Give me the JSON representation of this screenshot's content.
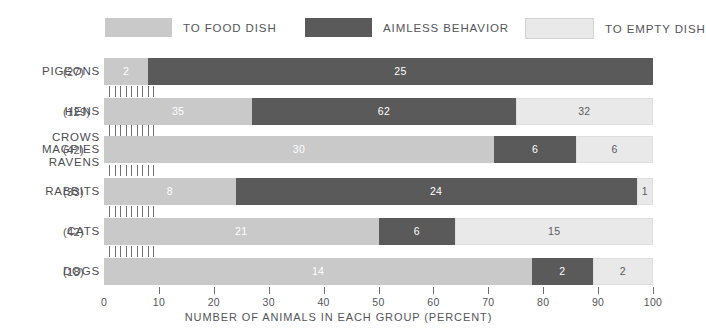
{
  "legend": {
    "items": [
      {
        "label": "TO FOOD DISH",
        "color": "#c9c9c9",
        "key": "to_food_dish"
      },
      {
        "label": "AIMLESS BEHAVIOR",
        "color": "#5a5a5a",
        "key": "aimless_behavior"
      },
      {
        "label": "TO EMPTY DISH",
        "color": "#e9e9e9",
        "key": "to_empty_dish"
      }
    ]
  },
  "axis": {
    "title": "NUMBER OF ANIMALS IN EACH GROUP (PERCENT)",
    "ticks": [
      "0",
      "10",
      "20",
      "30",
      "40",
      "50",
      "60",
      "70",
      "80",
      "90",
      "100"
    ]
  },
  "rows": [
    {
      "name_lines": [
        "PIGEONS"
      ],
      "count": "(27)",
      "segments": [
        {
          "key": "to_food_dish",
          "label": "2",
          "start": 0,
          "end": 8
        },
        {
          "key": "aimless_behavior",
          "label": "25",
          "start": 8,
          "end": 100
        }
      ]
    },
    {
      "name_lines": [
        "HENS"
      ],
      "count": "(129)",
      "segments": [
        {
          "key": "to_food_dish",
          "label": "35",
          "start": 0,
          "end": 27
        },
        {
          "key": "aimless_behavior",
          "label": "62",
          "start": 27,
          "end": 75
        },
        {
          "key": "to_empty_dish",
          "label": "32",
          "start": 75,
          "end": 100
        }
      ]
    },
    {
      "name_lines": [
        "CROWS",
        "MAGPIES",
        "RAVENS"
      ],
      "count": "(42)",
      "segments": [
        {
          "key": "to_food_dish",
          "label": "30",
          "start": 0,
          "end": 71
        },
        {
          "key": "aimless_behavior",
          "label": "6",
          "start": 71,
          "end": 86
        },
        {
          "key": "to_empty_dish",
          "label": "6",
          "start": 86,
          "end": 100
        }
      ]
    },
    {
      "name_lines": [
        "RABBITS"
      ],
      "count": "(33)",
      "segments": [
        {
          "key": "to_food_dish",
          "label": "8",
          "start": 0,
          "end": 24
        },
        {
          "key": "aimless_behavior",
          "label": "24",
          "start": 24,
          "end": 97
        },
        {
          "key": "to_empty_dish",
          "label": "1",
          "start": 97,
          "end": 100
        }
      ]
    },
    {
      "name_lines": [
        "CATS"
      ],
      "count": "(42)",
      "segments": [
        {
          "key": "to_food_dish",
          "label": "21",
          "start": 0,
          "end": 50
        },
        {
          "key": "aimless_behavior",
          "label": "6",
          "start": 50,
          "end": 64
        },
        {
          "key": "to_empty_dish",
          "label": "15",
          "start": 64,
          "end": 100
        }
      ]
    },
    {
      "name_lines": [
        "DOGS"
      ],
      "count": "(18)",
      "segments": [
        {
          "key": "to_food_dish",
          "label": "14",
          "start": 0,
          "end": 78
        },
        {
          "key": "aimless_behavior",
          "label": "2",
          "start": 78,
          "end": 89
        },
        {
          "key": "to_empty_dish",
          "label": "2",
          "start": 89,
          "end": 100
        }
      ]
    }
  ],
  "chart_data": {
    "type": "bar",
    "title": "",
    "subtype": "horizontal stacked bar (100% stacked)",
    "xlabel": "NUMBER OF ANIMALS IN EACH GROUP (PERCENT)",
    "ylabel": "",
    "xlim": [
      0,
      100
    ],
    "grid": false,
    "legend_position": "top",
    "categories": [
      "PIGEONS",
      "HENS",
      "CROWS MAGPIES RAVENS",
      "RABBITS",
      "CATS",
      "DOGS"
    ],
    "group_sizes": [
      27,
      129,
      42,
      33,
      42,
      18
    ],
    "series": [
      {
        "name": "TO FOOD DISH",
        "color": "#c9c9c9",
        "counts": [
          2,
          35,
          30,
          8,
          21,
          14
        ],
        "percents": [
          8,
          27,
          71,
          24,
          50,
          78
        ]
      },
      {
        "name": "AIMLESS BEHAVIOR",
        "color": "#5a5a5a",
        "counts": [
          25,
          62,
          6,
          24,
          6,
          2
        ],
        "percents": [
          92,
          48,
          15,
          73,
          14,
          11
        ]
      },
      {
        "name": "TO EMPTY DISH",
        "color": "#e9e9e9",
        "counts": [
          0,
          32,
          6,
          1,
          15,
          2
        ],
        "percents": [
          0,
          25,
          14,
          3,
          36,
          11
        ]
      }
    ],
    "xticks": [
      0,
      10,
      20,
      30,
      40,
      50,
      60,
      70,
      80,
      90,
      100
    ],
    "annotations": "Segment labels are animal counts; bar widths are percent of each group."
  }
}
